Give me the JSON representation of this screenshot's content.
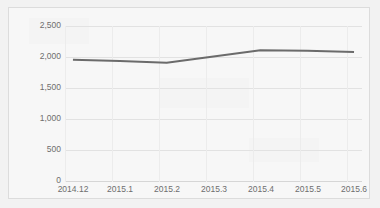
{
  "chart_data": {
    "type": "line",
    "title": "",
    "subtitle": "",
    "xlabel": "",
    "ylabel": "",
    "categories": [
      "2014.12",
      "2015.1",
      "2015.2",
      "2015.3",
      "2015.4",
      "2015.5",
      "2015.6"
    ],
    "series": [
      {
        "name": "series-1",
        "color": "#6b6b6b",
        "values": [
          1960,
          1940,
          1910,
          2010,
          2110,
          2105,
          2085
        ]
      }
    ],
    "ylim": [
      0,
      2500
    ],
    "yticks": [
      0,
      500,
      1000,
      1500,
      2000,
      2500
    ],
    "ytick_labels": [
      "0",
      "500",
      "1,000",
      "1,500",
      "2,000",
      "2,500"
    ],
    "grid": true,
    "grid_axis": "both",
    "legend": false,
    "legend_position": "none",
    "markers": false
  },
  "style": {
    "line_color": "#6b6b6b",
    "grid_color": "#e2e2e2",
    "axis_color": "#d6d6d6",
    "tick_label_color": "#6e6e6e",
    "plot_background": "#f7f7f7",
    "page_background": "#f2f2f2",
    "card_border_color": "#dcdcdc"
  }
}
